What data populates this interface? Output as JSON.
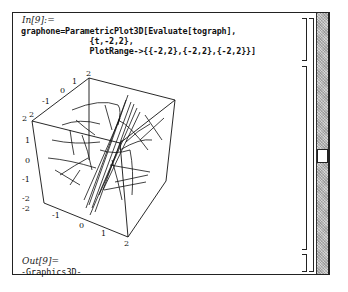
{
  "notebook": {
    "input_label": "In[9]:=",
    "input_code_lines": [
      "graphone=ParametricPlot3D[Evaluate[tograph],",
      "              {t,-2,2},",
      "              PlotRange->{{-2,2},{-2,2},{-2,2}}]"
    ],
    "output_label": "Out[9]=",
    "output_value": "-Graphics3D-"
  },
  "plot": {
    "type": "3D parametric curves in bounding box",
    "axes": {
      "vertical_ticks": [
        "2",
        "1",
        "0",
        "-1",
        "-2"
      ],
      "top_edge_ticks": [
        "2",
        "1",
        "0",
        "-1",
        "2"
      ],
      "bottom_edge_ticks": [
        "-2",
        "-1",
        "0",
        "1",
        "2"
      ]
    },
    "plot_range": [
      [
        -2,
        2
      ],
      [
        -2,
        2
      ],
      [
        -2,
        2
      ]
    ]
  },
  "scrollbar": {
    "thumb_position_percent": 52
  },
  "colors": {
    "background": "#ffffff",
    "ink": "#111111",
    "scrollbar_pattern": "#bdbdbd"
  }
}
